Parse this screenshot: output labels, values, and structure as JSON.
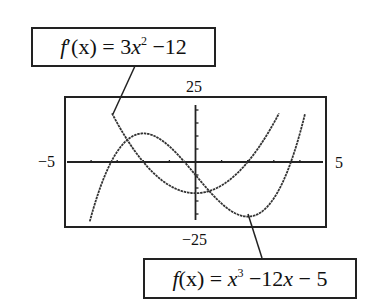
{
  "chart_data": {
    "type": "line",
    "title": "",
    "xlabel": "",
    "ylabel": "",
    "xlim": [
      -5,
      5
    ],
    "ylim": [
      -25,
      25
    ],
    "grid": false,
    "window_labels": {
      "xmin": "−5",
      "xmax": "5",
      "ymin": "−25",
      "ymax": "25"
    },
    "xticks_step": 1,
    "yticks_step": 5,
    "series": [
      {
        "name": "f(x) = x^3 - 12x - 5",
        "expression": "x^3 - 12x - 5",
        "x": [
          -4,
          -3.5,
          -3,
          -2.5,
          -2,
          -1.5,
          -1,
          -0.5,
          0,
          0.5,
          1,
          1.5,
          2,
          2.5,
          3,
          3.5,
          4,
          4.2
        ],
        "values": [
          -21,
          -7.875,
          4,
          9.375,
          11,
          9.625,
          6,
          0.875,
          -5,
          -10.875,
          -16,
          -19.625,
          -21,
          -19.375,
          -14,
          -4.125,
          11,
          18.7
        ],
        "local_max": [
          -2,
          11
        ],
        "local_min": [
          2,
          -21
        ]
      },
      {
        "name": "f'(x) = 3x^2 - 12",
        "expression": "3x^2 - 12",
        "x": [
          -3.2,
          -3,
          -2.5,
          -2,
          -1.5,
          -1,
          -0.5,
          0,
          0.5,
          1,
          1.5,
          2,
          2.5,
          3,
          3.2
        ],
        "values": [
          18.72,
          15,
          6.75,
          0,
          -5.25,
          -9,
          -11.25,
          -12,
          -11.25,
          -9,
          -5.25,
          0,
          6.75,
          15,
          18.72
        ],
        "minimum": [
          0,
          -12
        ]
      }
    ],
    "annotations": [
      {
        "text": "f'(x) = 3x² − 12",
        "points_to": "derivative curve"
      },
      {
        "text": "f(x) = x³ − 12x − 5",
        "points_to": "cubic curve local minimum"
      }
    ]
  },
  "labels": {
    "deriv": {
      "fn": "f",
      "prime": "′",
      "arg": "(x) = 3",
      "var": "x",
      "exp": "2",
      "rest": " −12"
    },
    "func": {
      "fn": "f",
      "arg": "(x) = ",
      "var": "x",
      "exp": "3",
      "rest1": " −12",
      "var2": "x",
      "rest2": " − 5"
    }
  },
  "colors": {
    "ink": "#222222",
    "background": "#ffffff"
  }
}
